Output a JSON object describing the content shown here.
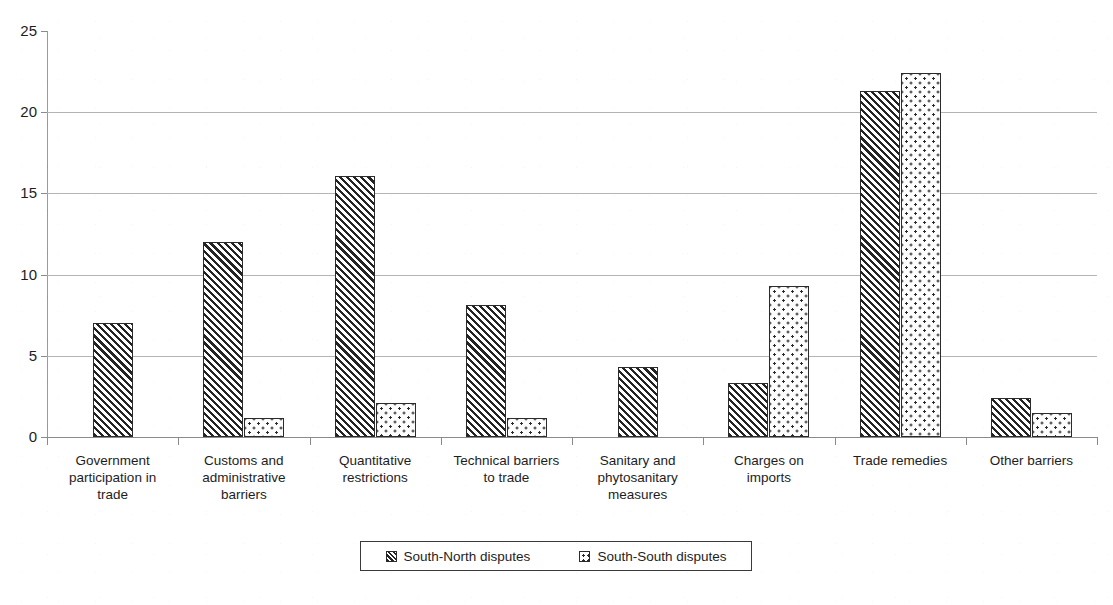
{
  "chart_data": {
    "type": "bar",
    "title": "",
    "subtitle": "",
    "xlabel": "",
    "ylabel": "",
    "ylim": [
      0,
      25
    ],
    "yticks": [
      0,
      5,
      10,
      15,
      20,
      25
    ],
    "grid": true,
    "legend_position": "bottom",
    "categories": [
      "Government participation in trade",
      "Customs and administrative barriers",
      "Quantitative restrictions",
      "Technical barriers to trade",
      "Sanitary and phytosanitary measures",
      "Charges on imports",
      "Trade remedies",
      "Other barriers"
    ],
    "category_lines": [
      [
        "Government",
        "participation in",
        "trade"
      ],
      [
        "Customs and",
        "administrative",
        "barriers"
      ],
      [
        "Quantitative",
        "restrictions"
      ],
      [
        "Technical barriers",
        "to trade"
      ],
      [
        "Sanitary and",
        "phytosanitary",
        "measures"
      ],
      [
        "Charges on",
        "imports"
      ],
      [
        "Trade remedies"
      ],
      [
        "Other barriers"
      ]
    ],
    "series": [
      {
        "name": "South-North disputes",
        "pattern": "diagonal-hatch",
        "values": [
          7.0,
          12.0,
          16.1,
          8.1,
          4.3,
          3.3,
          21.3,
          2.4
        ]
      },
      {
        "name": "South-South disputes",
        "pattern": "dotted",
        "values": [
          0,
          1.2,
          2.1,
          1.2,
          0,
          9.3,
          22.4,
          1.5
        ]
      }
    ]
  },
  "legend": {
    "items": [
      {
        "label": "South-North disputes",
        "swatch": "hatch-swatch-icon"
      },
      {
        "label": "South-South disputes",
        "swatch": "dot-swatch-icon"
      }
    ]
  },
  "axis": {
    "y_tick_labels": [
      "0",
      "5",
      "10",
      "15",
      "20",
      "25"
    ]
  }
}
